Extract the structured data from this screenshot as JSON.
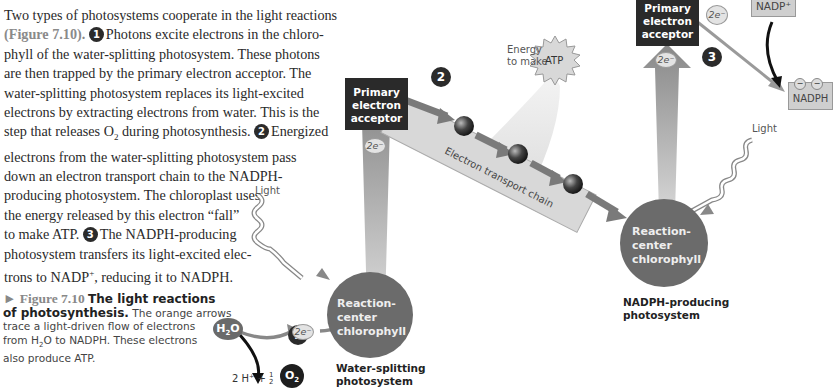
{
  "paragraph": {
    "lines": [
      "Two types of photosystems cooperate in the light reactions",
      "(Figure 7.10).",
      "Photons excite electrons in the chloro-",
      "phyll of the water-splitting photosystem. These photons",
      "are then trapped by the primary electron acceptor. The",
      "water-splitting photosystem replaces its light-excited",
      "electrons by extracting electrons from water. This is the",
      "step that releases O",
      "during photosynthesis.",
      "Energized",
      "electrons from the water-splitting photosystem pass",
      "down an electron transport chain to the NADPH-",
      "producing photosystem. The chloroplast uses",
      "the energy released by this electron “fall”",
      "to make ATP.",
      "The NADPH-producing",
      "photosystem transfers its light-excited elec-",
      "trons to NADP",
      ", reducing it to NADPH."
    ],
    "step_markers": [
      "1",
      "2",
      "3"
    ],
    "o2_sub": "2",
    "nadp_sup": "+"
  },
  "caption": {
    "figure_label": "► Figure 7.10",
    "title_a": "The light reactions",
    "title_b": "of photosynthesis.",
    "text_a": "The orange arrows",
    "text_b": "trace a light-driven flow of electrons",
    "text_c": "from H",
    "text_c_sub": "2",
    "text_c_rest": "O to NADPH. These electrons",
    "text_d": "also produce ATP."
  },
  "diagram": {
    "left_acceptor": [
      "Primary",
      "electron",
      "acceptor"
    ],
    "right_acceptor": [
      "Primary",
      "electron",
      "acceptor"
    ],
    "electron_label": "2e⁻",
    "light_label": "Light",
    "reaction_center": [
      "Reaction-",
      "center",
      "chlorophyll"
    ],
    "water_splitting_label": [
      "Water-splitting",
      "photosystem"
    ],
    "nadph_producing_label": [
      "NADPH-producing",
      "photosystem"
    ],
    "h2o": {
      "main": "H",
      "sub": "2",
      "rest": "O"
    },
    "products": {
      "prefix": "2 H⁺ +",
      "frac_num": "1",
      "frac_den": "2",
      "o2_main": "O",
      "o2_sub": "2"
    },
    "energy_label": [
      "Energy",
      "to make"
    ],
    "atp_label": "ATP",
    "etc_label": "Electron transport chain",
    "nadp_label": "NADP⁺",
    "nadph_label": "NADPH",
    "step_numbers": [
      "1",
      "2",
      "3"
    ]
  },
  "colors": {
    "dark_box": "#2a2a2a",
    "chlorophyll_circle": "#6b6b6b",
    "arrow_gray": "#8a8a8a",
    "etc_box": "#d8d8d8"
  }
}
